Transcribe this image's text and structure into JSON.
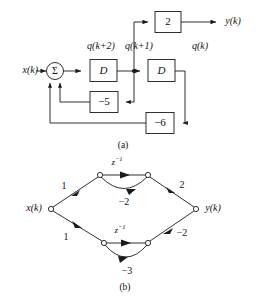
{
  "figure": {
    "title_a": "(a)",
    "title_b": "(b)",
    "diagram_a": {
      "name": "block-diagram-direct-form",
      "input_label": "x(k)",
      "output_label": "y(k)",
      "state_labels": {
        "q_k_plus_2": "q(k+2)",
        "q_k_plus_1": "q(k+1)",
        "q_k": "q(k)"
      },
      "summer_symbol": "Σ",
      "blocks": [
        {
          "id": "delay-1",
          "label": "D",
          "type": "delay"
        },
        {
          "id": "delay-2",
          "label": "D",
          "type": "delay"
        },
        {
          "id": "gain-output",
          "label": "2",
          "type": "gain"
        },
        {
          "id": "gain-feedback-1",
          "label": "−5",
          "type": "gain"
        },
        {
          "id": "gain-feedback-2",
          "label": "−6",
          "type": "gain"
        }
      ]
    },
    "diagram_b": {
      "name": "signal-flow-graph-parallel-form",
      "input_label": "x(k)",
      "output_label": "y(k)",
      "branch_labels": {
        "upper_in": "1",
        "upper_delay": "z",
        "upper_delay_exp": "−1",
        "upper_feedback": "−2",
        "upper_out": "2",
        "lower_in": "1",
        "lower_delay": "z",
        "lower_delay_exp": "−1",
        "lower_feedback": "−3",
        "lower_out": "−2"
      }
    }
  },
  "colors": {
    "line": "#1a1a1a",
    "text": "#111111",
    "background": "#ffffff"
  }
}
